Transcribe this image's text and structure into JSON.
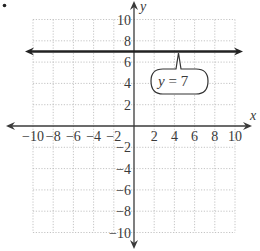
{
  "chart_data": {
    "type": "line",
    "title": "",
    "xlabel": "x",
    "ylabel": "y",
    "xlim": [
      -10,
      10
    ],
    "ylim": [
      -10,
      10
    ],
    "grid": true,
    "x_ticks": [
      -10,
      -8,
      -6,
      -4,
      -2,
      2,
      4,
      6,
      8,
      10
    ],
    "y_ticks": [
      -10,
      -8,
      -6,
      -4,
      -2,
      2,
      4,
      6,
      8,
      10
    ],
    "x_tick_labels": [
      "−10",
      "−8",
      "−6",
      "−4",
      "−2",
      "2",
      "4",
      "6",
      "8",
      "10"
    ],
    "y_tick_labels": [
      "−10",
      "−8",
      "−6",
      "−4",
      "−2",
      "2",
      "4",
      "6",
      "8",
      "10"
    ],
    "series": [
      {
        "name": "y = 7",
        "x": [
          -10,
          10
        ],
        "y": [
          7,
          7
        ],
        "style": "horizontal line with arrows at both ends"
      }
    ],
    "annotations": [
      {
        "text": "y = 7",
        "type": "callout",
        "points_to": [
          4,
          7
        ]
      }
    ],
    "legend": "none"
  },
  "labels": {
    "x_axis": "x",
    "y_axis": "y",
    "callout_y": "y",
    "callout_eq": " = 7"
  },
  "bullet": "•",
  "colors": {
    "axis": "#3a3a3a",
    "line": "#222222",
    "grid": "#b5b5b5"
  }
}
